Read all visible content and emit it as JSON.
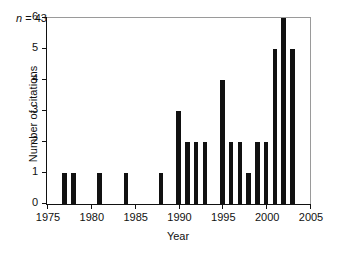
{
  "chart_data": {
    "type": "bar",
    "title": "",
    "subtitle": "",
    "xlabel": "Year",
    "ylabel": "Number of citations",
    "xlim": [
      1975,
      2005
    ],
    "ylim": [
      0,
      6
    ],
    "xticks": [
      1975,
      1980,
      1985,
      1990,
      1995,
      2000,
      2005
    ],
    "yticks": [
      0,
      1,
      2,
      3,
      4,
      5,
      6
    ],
    "grid": false,
    "legend": null,
    "bar_color": "#111111",
    "background_color": "#ffffff",
    "axis_color": "#111111",
    "annotations": [
      {
        "symbol": "n",
        "text": " = 43",
        "full": "n = 43",
        "x": 1977,
        "y": 5.5
      }
    ],
    "categories": [
      1977,
      1978,
      1981,
      1984,
      1988,
      1990,
      1991,
      1992,
      1993,
      1995,
      1996,
      1997,
      1998,
      1999,
      2000,
      2001,
      2002,
      2003
    ],
    "values": [
      1,
      1,
      1,
      1,
      1,
      3,
      2,
      2,
      2,
      4,
      2,
      2,
      1,
      2,
      2,
      5,
      6,
      5
    ],
    "points": [
      {
        "x": 1977,
        "y": 1
      },
      {
        "x": 1978,
        "y": 1
      },
      {
        "x": 1981,
        "y": 1
      },
      {
        "x": 1984,
        "y": 1
      },
      {
        "x": 1988,
        "y": 1
      },
      {
        "x": 1990,
        "y": 3
      },
      {
        "x": 1991,
        "y": 2
      },
      {
        "x": 1992,
        "y": 2
      },
      {
        "x": 1993,
        "y": 2
      },
      {
        "x": 1995,
        "y": 4
      },
      {
        "x": 1996,
        "y": 2
      },
      {
        "x": 1997,
        "y": 2
      },
      {
        "x": 1998,
        "y": 1
      },
      {
        "x": 1999,
        "y": 2
      },
      {
        "x": 2000,
        "y": 2
      },
      {
        "x": 2001,
        "y": 5
      },
      {
        "x": 2002,
        "y": 6
      },
      {
        "x": 2003,
        "y": 5
      }
    ]
  }
}
